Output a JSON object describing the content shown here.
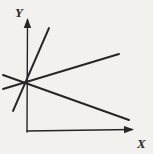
{
  "diagram": {
    "type": "line-diagram",
    "y_label": "Y",
    "x_label": "X",
    "colors": {
      "background": "#f2f1ee",
      "ink": "#262626"
    },
    "intersection_point": {
      "x": 27,
      "y": 83
    },
    "axes": [
      {
        "name": "y-axis",
        "x1": 27,
        "y1": 132,
        "x2": 27.5,
        "y2": 20,
        "width": 1.4,
        "arrow": true
      },
      {
        "name": "x-axis",
        "x1": 27,
        "y1": 131,
        "x2": 132,
        "y2": 129.5,
        "width": 1.4,
        "arrow": true
      }
    ],
    "lines": [
      {
        "name": "steep-ascending-line",
        "x1": 13,
        "y1": 111,
        "x2": 49,
        "y2": 28,
        "width": 1.9,
        "arrow": false
      },
      {
        "name": "shallow-ascending-line",
        "x1": 3,
        "y1": 89,
        "x2": 119,
        "y2": 54,
        "width": 1.9,
        "arrow": false
      },
      {
        "name": "descending-line",
        "x1": 3,
        "y1": 75,
        "x2": 129,
        "y2": 120,
        "width": 1.9,
        "arrow": false
      }
    ]
  }
}
